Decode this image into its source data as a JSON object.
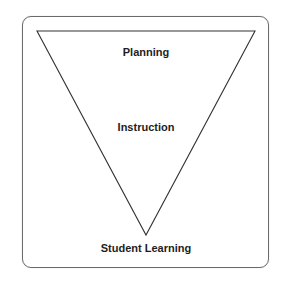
{
  "diagram": {
    "type": "inverted-triangle",
    "labels": {
      "top": "Planning",
      "middle": "Instruction",
      "bottom": "Student Learning"
    },
    "colors": {
      "line": "#333333",
      "frame": "#6b6b6b",
      "text": "#1e1e1e",
      "background": "#ffffff"
    }
  }
}
